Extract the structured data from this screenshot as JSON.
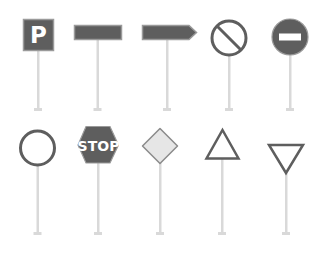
{
  "colors": {
    "background": "#ffffff",
    "sign_fill": "#5e5e5e",
    "sign_outline": "#9a9a9a",
    "pole": "#d9d9d9",
    "diamond_fill": "#e6e6e6",
    "text": "#ffffff"
  },
  "rows": [
    {
      "signs": [
        {
          "id": "parking",
          "type": "square",
          "label": "P"
        },
        {
          "id": "rect-plate",
          "type": "rectangle",
          "label": ""
        },
        {
          "id": "arrow-plate",
          "type": "arrow",
          "label": ""
        },
        {
          "id": "no-parking",
          "type": "circle-slash",
          "label": ""
        },
        {
          "id": "no-entry",
          "type": "circle-bar",
          "label": ""
        }
      ]
    },
    {
      "signs": [
        {
          "id": "empty-circle",
          "type": "circle-outline",
          "label": ""
        },
        {
          "id": "stop",
          "type": "octagon",
          "label": "STOP"
        },
        {
          "id": "priority-road",
          "type": "diamond",
          "label": ""
        },
        {
          "id": "warning",
          "type": "triangle-up",
          "label": ""
        },
        {
          "id": "yield",
          "type": "triangle-down",
          "label": ""
        }
      ]
    }
  ]
}
